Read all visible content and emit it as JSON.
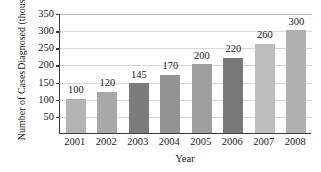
{
  "chart_data": {
    "type": "bar",
    "title": "",
    "xlabel": "Year",
    "ylabel": "Number of Cases Diagnosed (thousands)",
    "ylabel_line1": "Number of Cases",
    "ylabel_line2": "Diagnosed (thousands)",
    "categories": [
      "2001",
      "2002",
      "2003",
      "2004",
      "2005",
      "2006",
      "2007",
      "2008"
    ],
    "values": [
      100,
      120,
      145,
      170,
      200,
      220,
      260,
      300
    ],
    "value_labels": [
      "100",
      "120",
      "145",
      "170",
      "200",
      "220",
      "260",
      "300"
    ],
    "ylim": [
      0,
      350
    ],
    "ytick_labels": [
      "50",
      "100",
      "150",
      "200",
      "250",
      "300",
      "350"
    ],
    "ytick_values": [
      50,
      100,
      150,
      200,
      250,
      300,
      350
    ],
    "grid": true,
    "legend": "none",
    "bar_colors": [
      "#b3b3b3",
      "#a8a8a8",
      "#7c7c7c",
      "#939393",
      "#9e9e9e",
      "#787878",
      "#bdbdbd",
      "#b0b0b0"
    ],
    "axis_color": "#3a3a3a",
    "grid_color": "#d9d9d9",
    "background": "#ffffff"
  }
}
